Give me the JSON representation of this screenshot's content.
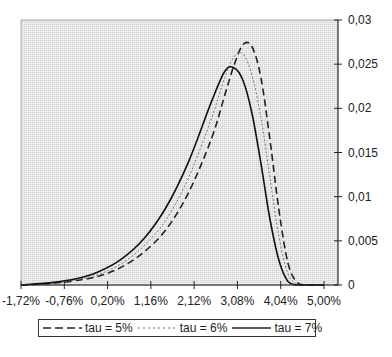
{
  "chart_data": {
    "type": "line",
    "title": "",
    "xlabel": "",
    "ylabel": "",
    "x_tick_labels": [
      "-1,72%",
      "-0,76%",
      "0,20%",
      "1,16%",
      "2,12%",
      "3,08%",
      "4,04%",
      "5,00%"
    ],
    "x_ticks": [
      -1.72,
      -0.76,
      0.2,
      1.16,
      2.12,
      3.08,
      4.04,
      5.0
    ],
    "xlim": [
      -1.72,
      5.0
    ],
    "y_tick_labels": [
      "0",
      "0,005",
      "0,01",
      "0,015",
      "0,02",
      "0,025",
      "0,03"
    ],
    "y_ticks": [
      0,
      0.005,
      0.01,
      0.015,
      0.02,
      0.025,
      0.03
    ],
    "ylim": [
      0,
      0.03
    ],
    "y_axis_position": "right",
    "grid": false,
    "plot_background": "#e6e6e6",
    "legend_position": "bottom",
    "x": [
      -1.72,
      -1.0,
      -0.5,
      0.0,
      0.5,
      1.0,
      1.5,
      2.0,
      2.5,
      2.8,
      3.0,
      3.2,
      3.4,
      3.6,
      3.8,
      4.0,
      4.2,
      4.4,
      4.6,
      5.0
    ],
    "series": [
      {
        "name": "tau = 5%",
        "style": "dashed",
        "values": [
          0,
          0.0002,
          0.0005,
          0.001,
          0.002,
          0.0037,
          0.0063,
          0.0105,
          0.0165,
          0.0215,
          0.0248,
          0.0272,
          0.027,
          0.0235,
          0.0165,
          0.0085,
          0.0025,
          0.0003,
          0,
          0
        ]
      },
      {
        "name": "tau = 6%",
        "style": "dotted",
        "values": [
          0,
          0.0002,
          0.0006,
          0.0012,
          0.0024,
          0.0044,
          0.0074,
          0.0122,
          0.0188,
          0.0235,
          0.0258,
          0.0262,
          0.0238,
          0.019,
          0.0122,
          0.0055,
          0.0013,
          0.0001,
          0,
          0
        ]
      },
      {
        "name": "tau = 7%",
        "style": "solid",
        "values": [
          0,
          0.0003,
          0.0007,
          0.0015,
          0.0029,
          0.0052,
          0.0088,
          0.014,
          0.0207,
          0.0242,
          0.0246,
          0.0232,
          0.0195,
          0.0138,
          0.0075,
          0.0028,
          0.0004,
          0,
          0,
          0
        ]
      }
    ]
  },
  "legend": {
    "items": [
      {
        "label": "tau = 5%",
        "style": "dashed"
      },
      {
        "label": "tau = 6%",
        "style": "dotted"
      },
      {
        "label": "tau = 7%",
        "style": "solid"
      }
    ]
  }
}
